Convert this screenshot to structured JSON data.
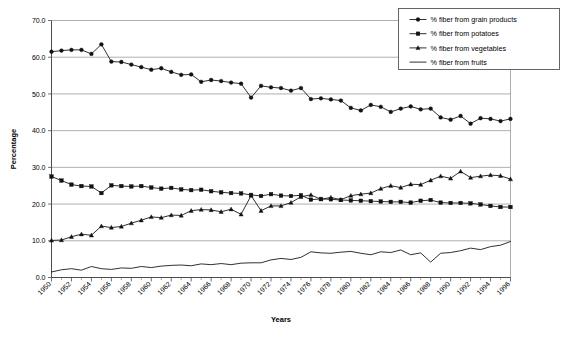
{
  "chart_data": {
    "type": "line",
    "title": "",
    "xlabel": "Years",
    "ylabel": "Percentage",
    "xlim": [
      1950,
      1996
    ],
    "ylim": [
      0.0,
      70.0
    ],
    "ytick_step": 10.0,
    "grid": true,
    "legend_position": "top-right",
    "ytick_labels": [
      "0.0",
      "10.0",
      "20.0",
      "30.0",
      "40.0",
      "50.0",
      "60.0",
      "70.0"
    ],
    "ytick_values": [
      0.0,
      10.0,
      20.0,
      30.0,
      40.0,
      50.0,
      60.0,
      70.0
    ],
    "xtick_labels": [
      "1950",
      "1952",
      "1954",
      "1956",
      "1958",
      "1960",
      "1962",
      "1964",
      "1966",
      "1968",
      "1970",
      "1972",
      "1974",
      "1976",
      "1978",
      "1980",
      "1982",
      "1984",
      "1986",
      "1988",
      "1990",
      "1992",
      "1994",
      "1996"
    ],
    "xtick_values": [
      1950,
      1952,
      1954,
      1956,
      1958,
      1960,
      1962,
      1964,
      1966,
      1968,
      1970,
      1972,
      1974,
      1976,
      1978,
      1980,
      1982,
      1984,
      1986,
      1988,
      1990,
      1992,
      1994,
      1996
    ],
    "x": [
      1950,
      1951,
      1952,
      1953,
      1954,
      1955,
      1956,
      1957,
      1958,
      1959,
      1960,
      1961,
      1962,
      1963,
      1964,
      1965,
      1966,
      1967,
      1968,
      1969,
      1970,
      1971,
      1972,
      1973,
      1974,
      1975,
      1976,
      1977,
      1978,
      1979,
      1980,
      1981,
      1982,
      1983,
      1984,
      1985,
      1986,
      1987,
      1988,
      1989,
      1990,
      1991,
      1992,
      1993,
      1994,
      1995,
      1996
    ],
    "series": [
      {
        "name": "% fiber from grain products",
        "marker": "circle",
        "values": [
          61.5,
          61.8,
          62.0,
          62.0,
          60.9,
          63.5,
          58.8,
          58.7,
          58.0,
          57.3,
          56.6,
          57.0,
          56.0,
          55.2,
          55.3,
          53.3,
          53.8,
          53.5,
          53.1,
          52.8,
          49.0,
          52.2,
          51.8,
          51.6,
          50.9,
          51.6,
          48.6,
          48.8,
          48.5,
          48.2,
          46.2,
          45.5,
          47.0,
          46.5,
          45.1,
          46.0,
          46.6,
          45.8,
          46.0,
          43.6,
          43.0,
          44.0,
          41.9,
          43.4,
          43.2,
          42.6,
          43.2
        ]
      },
      {
        "name": "% fiber from potatoes",
        "marker": "square",
        "values": [
          27.5,
          26.4,
          25.3,
          24.9,
          24.8,
          23.0,
          25.1,
          24.9,
          24.8,
          24.9,
          24.5,
          24.2,
          24.4,
          24.0,
          23.8,
          23.9,
          23.5,
          23.2,
          23.0,
          22.9,
          22.5,
          22.2,
          22.7,
          22.3,
          22.2,
          22.4,
          21.2,
          21.4,
          21.3,
          21.1,
          21.0,
          20.9,
          20.8,
          20.7,
          20.6,
          20.6,
          20.4,
          20.9,
          21.1,
          20.4,
          20.3,
          20.3,
          20.2,
          19.9,
          19.5,
          19.2,
          19.2
        ]
      },
      {
        "name": "% fiber from vegetables",
        "marker": "triangle",
        "values": [
          10.1,
          10.2,
          11.1,
          11.8,
          11.5,
          14.0,
          13.6,
          13.9,
          14.8,
          15.6,
          16.5,
          16.3,
          17.0,
          16.9,
          18.2,
          18.5,
          18.4,
          17.9,
          18.6,
          17.2,
          22.3,
          18.2,
          19.5,
          19.5,
          20.4,
          22.0,
          22.5,
          21.3,
          21.8,
          21.2,
          22.3,
          22.7,
          23.0,
          24.2,
          25.0,
          24.5,
          25.4,
          25.3,
          26.5,
          27.6,
          27.0,
          28.9,
          27.2,
          27.6,
          27.9,
          27.7,
          26.8
        ]
      },
      {
        "name": "% fiber from fruits",
        "marker": "none",
        "values": [
          1.5,
          2.1,
          2.4,
          2.0,
          3.0,
          2.4,
          2.2,
          2.6,
          2.5,
          3.0,
          2.7,
          3.1,
          3.3,
          3.4,
          3.2,
          3.7,
          3.5,
          3.8,
          3.5,
          3.9,
          4.0,
          4.0,
          4.8,
          5.2,
          4.9,
          5.5,
          7.0,
          6.7,
          6.6,
          6.9,
          7.1,
          6.6,
          6.2,
          7.0,
          6.8,
          7.5,
          6.2,
          6.7,
          4.2,
          6.6,
          6.8,
          7.3,
          8.0,
          7.6,
          8.4,
          8.8,
          9.8
        ]
      }
    ]
  },
  "legend": {
    "entries": [
      {
        "label": "% fiber from grain products",
        "marker": "circle"
      },
      {
        "label": "% fiber from potatoes",
        "marker": "square"
      },
      {
        "label": "% fiber from vegetables",
        "marker": "triangle"
      },
      {
        "label": "% fiber from fruits",
        "marker": "none"
      }
    ]
  }
}
